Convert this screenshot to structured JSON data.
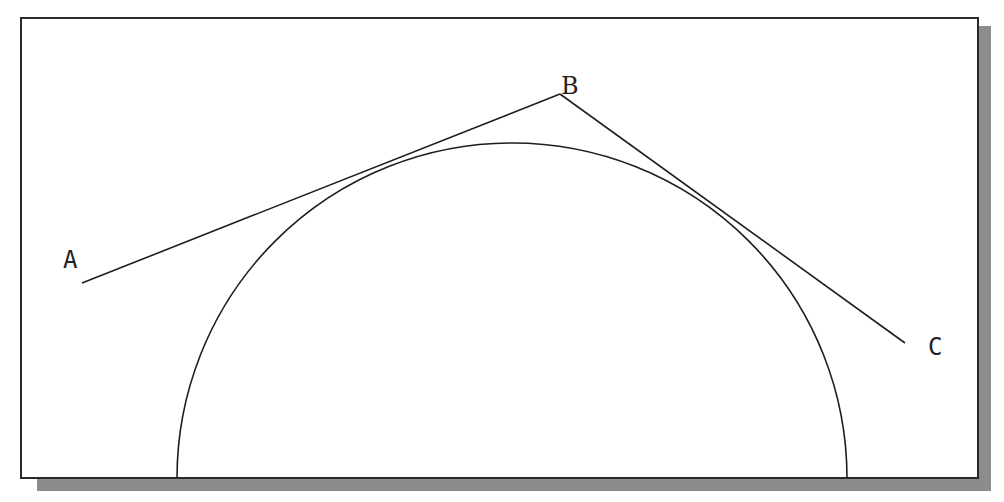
{
  "diagram": {
    "type": "tangent-arc-construction",
    "points": {
      "A": {
        "label": "A",
        "x": 82,
        "y": 283,
        "label_x": 63,
        "label_y": 268
      },
      "B": {
        "label": "B",
        "x": 560,
        "y": 94,
        "label_x": 561,
        "label_y": 94
      },
      "C": {
        "label": "C",
        "x": 905,
        "y": 343,
        "label_x": 928,
        "label_y": 355
      }
    },
    "segments": [
      {
        "from": "A",
        "to": "B"
      },
      {
        "from": "B",
        "to": "C"
      }
    ],
    "arc": {
      "center_x": 512,
      "center_y": 471,
      "radius": 335,
      "start": {
        "x": 177,
        "y": 478
      },
      "end": {
        "x": 847,
        "y": 478
      }
    },
    "colors": {
      "line": "#1e1e1e",
      "frame_border": "#2a2a2a",
      "shadow": "#8c8c8c",
      "background": "#ffffff"
    }
  }
}
